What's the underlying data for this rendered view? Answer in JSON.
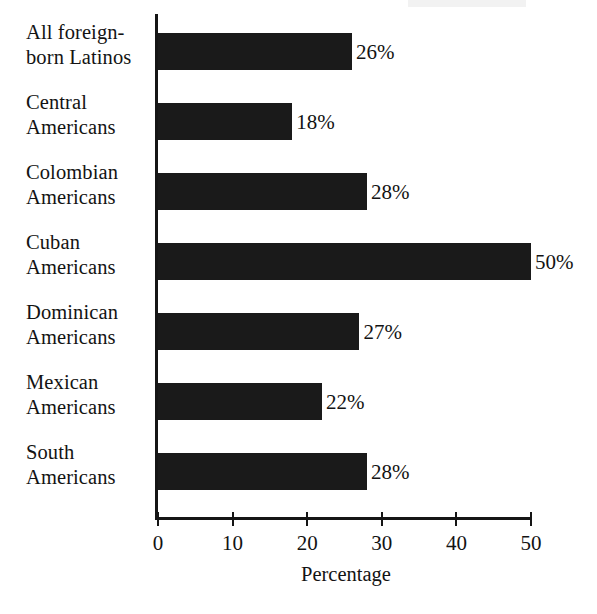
{
  "chart_data": {
    "type": "bar",
    "orientation": "horizontal",
    "title": "",
    "xlabel": "Percentage",
    "ylabel": "",
    "xlim": [
      0,
      50
    ],
    "x_ticks": [
      0,
      10,
      20,
      30,
      40,
      50
    ],
    "x_tick_labels": [
      "0",
      "10",
      "20",
      "30",
      "40",
      "50"
    ],
    "grid": false,
    "legend": null,
    "bar_color": "#1a1a1a",
    "axis_color": "#151515",
    "background_color": "#ffffff",
    "categories": [
      "All foreign-\nborn Latinos",
      "Central\nAmericans",
      "Colombian\nAmericans",
      "Cuban\nAmericans",
      "Dominican\nAmericans",
      "Mexican\nAmericans",
      "South\nAmericans"
    ],
    "values": [
      26,
      18,
      28,
      50,
      27,
      22,
      28
    ],
    "data_labels": [
      "26%",
      "18%",
      "28%",
      "50%",
      "27%",
      "22%",
      "28%"
    ]
  },
  "axis": {
    "x_title": "Percentage"
  }
}
